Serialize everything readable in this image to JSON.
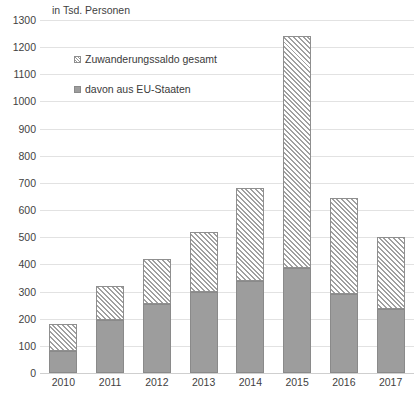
{
  "chart_data": {
    "type": "bar",
    "subtype": "stacked-vertical",
    "title": "",
    "axis_note": "in Tsd. Personen",
    "xlabel": "",
    "ylabel": "",
    "categories": [
      "2010",
      "2011",
      "2012",
      "2013",
      "2014",
      "2015",
      "2016",
      "2017"
    ],
    "series": [
      {
        "name": "davon aus EU-Staaten",
        "style": "solid-gray",
        "values": [
          82,
          197,
          253,
          300,
          338,
          388,
          290,
          235
        ]
      },
      {
        "name": "Zuwanderungssaldo gesamt",
        "style": "diagonal-hatch",
        "note": "total stack height (EU segment plus hatched remainder)",
        "values": [
          180,
          320,
          420,
          520,
          680,
          1240,
          645,
          500
        ]
      }
    ],
    "totals": [
      180,
      320,
      420,
      520,
      680,
      1240,
      645,
      500
    ],
    "ylim": [
      0,
      1300
    ],
    "ytick_step": 100,
    "yticks": [
      0,
      100,
      200,
      300,
      400,
      500,
      600,
      700,
      800,
      900,
      1000,
      1100,
      1200,
      1300
    ],
    "grid": true,
    "legend_position": "inside-top-left",
    "colors": {
      "eu_fill": "#9d9d9d",
      "eu_border": "#8a8a8a",
      "total_fill": "#ffffff",
      "total_hatch": "#a0a0a0",
      "total_border": "#8f8f8f",
      "gridline": "#e2e2e2",
      "text": "#3f3f3f"
    }
  },
  "legend": {
    "total": {
      "label": "Zuwanderungssaldo gesamt",
      "marker": "hatched-square-icon"
    },
    "eu": {
      "label": "davon aus EU-Staaten",
      "marker": "gray-square-icon"
    }
  }
}
